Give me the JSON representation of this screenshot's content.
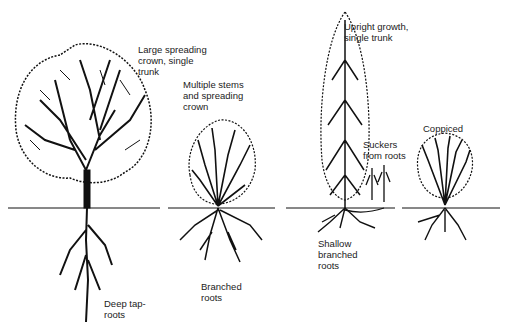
{
  "diagram": {
    "trees": [
      {
        "id": "large-spreading",
        "crown_label": "Large spreading\ncrown, single\ntrunk",
        "root_label": "Deep tap-\nroots"
      },
      {
        "id": "multiple-stems",
        "crown_label": "Multiple stems\nand spreading\ncrown",
        "root_label": "Branched\nroots"
      },
      {
        "id": "upright",
        "crown_label": "Upright growth,\nsingle trunk",
        "root_label": "Shallow\nbranched\nroots"
      },
      {
        "id": "suckers",
        "crown_label": "Suckers\nfrom roots"
      },
      {
        "id": "coppiced",
        "crown_label": "Coppiced"
      }
    ],
    "colors": {
      "ink": "#111111",
      "background": "#ffffff"
    }
  }
}
